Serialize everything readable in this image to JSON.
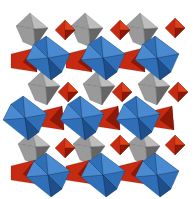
{
  "figure": {
    "title": "",
    "colors": {
      "blue_octahedron": "#2f6fb8",
      "blue_dark": "#1f4f8a",
      "blue_light": "#4a8ad0",
      "gray_polyhedron": "#9a9a9a",
      "gray_dark": "#666666",
      "gray_light": "#bdbdbd",
      "red_polyhedron": "#c62a10",
      "red_dark": "#8e1808",
      "red_light": "#e04018"
    },
    "polyhedra": {
      "blue": [
        {
          "x": 48,
          "y": 58
        },
        {
          "x": 103,
          "y": 58
        },
        {
          "x": 157,
          "y": 58
        },
        {
          "x": 25,
          "y": 118
        },
        {
          "x": 82,
          "y": 118
        },
        {
          "x": 138,
          "y": 118
        },
        {
          "x": 48,
          "y": 175
        },
        {
          "x": 103,
          "y": 175
        },
        {
          "x": 157,
          "y": 175
        }
      ],
      "gray": [
        {
          "x": 33,
          "y": 30
        },
        {
          "x": 88,
          "y": 30
        },
        {
          "x": 143,
          "y": 30
        },
        {
          "x": 45,
          "y": 88
        },
        {
          "x": 100,
          "y": 88
        },
        {
          "x": 155,
          "y": 88
        },
        {
          "x": 35,
          "y": 148
        },
        {
          "x": 90,
          "y": 148
        },
        {
          "x": 145,
          "y": 148
        }
      ],
      "red_square": [
        {
          "x": 65,
          "y": 30
        },
        {
          "x": 120,
          "y": 30
        },
        {
          "x": 175,
          "y": 28
        },
        {
          "x": 68,
          "y": 92
        },
        {
          "x": 122,
          "y": 92
        },
        {
          "x": 178,
          "y": 92
        },
        {
          "x": 65,
          "y": 148
        },
        {
          "x": 120,
          "y": 145
        },
        {
          "x": 175,
          "y": 145
        }
      ],
      "red_wedge": [
        {
          "x": 25,
          "y": 60
        },
        {
          "x": 80,
          "y": 60
        },
        {
          "x": 133,
          "y": 60
        },
        {
          "x": 52,
          "y": 118
        },
        {
          "x": 108,
          "y": 118
        },
        {
          "x": 162,
          "y": 118
        },
        {
          "x": 25,
          "y": 172
        },
        {
          "x": 80,
          "y": 172
        },
        {
          "x": 133,
          "y": 172
        }
      ]
    }
  }
}
